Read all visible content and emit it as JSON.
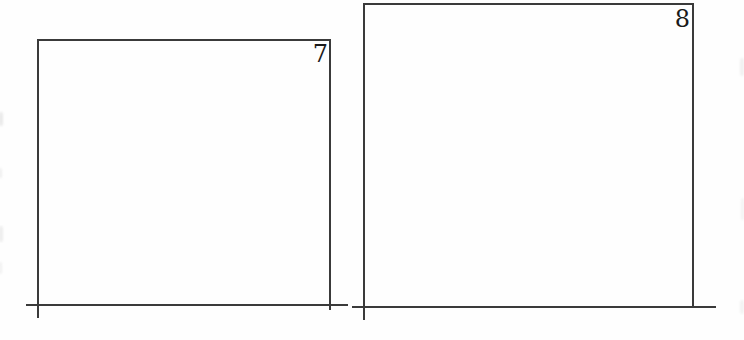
{
  "page": {
    "kind": "worksheet-answer-frames"
  },
  "panels": [
    {
      "number": "7"
    },
    {
      "number": "8"
    }
  ],
  "colors": {
    "line": "#3a3a3a",
    "text": "#1a1a1a",
    "background": "#fefefe"
  }
}
